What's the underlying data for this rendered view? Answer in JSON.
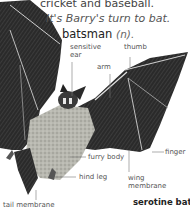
{
  "entry": {
    "line1": "cricket and baseball.",
    "example": "It's Barry's turn to bat.",
    "headword": "batsman",
    "part_of_speech": "(n)."
  },
  "illustration": {
    "subject": "bat",
    "caption": "serotine bat",
    "labels": {
      "sensitive_ear_1": "sensitive",
      "sensitive_ear_2": "ear",
      "thumb": "thumb",
      "arm": "arm",
      "furry_body": "furry body",
      "finger": "finger",
      "hind_leg": "hind leg",
      "wing_membrane_1": "wing",
      "wing_membrane_2": "membrane",
      "tail_membrane": "tail membrane"
    }
  }
}
